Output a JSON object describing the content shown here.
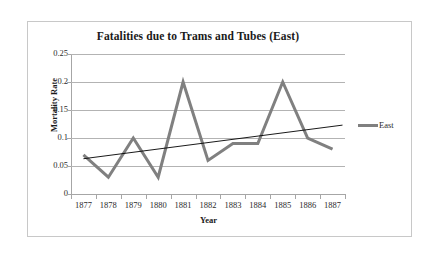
{
  "chart_data": {
    "type": "line",
    "title": "Fatalities due to Trams and Tubes (East)",
    "xlabel": "Year",
    "ylabel": "Mortality Rate",
    "categories": [
      "1877",
      "1878",
      "1879",
      "1880",
      "1881",
      "1882",
      "1883",
      "1884",
      "1885",
      "1886",
      "1887"
    ],
    "series": [
      {
        "name": "East",
        "color": "#808080",
        "values": [
          0.07,
          0.03,
          0.1,
          0.03,
          0.2,
          0.06,
          0.09,
          0.09,
          0.2,
          0.1,
          0.08
        ]
      }
    ],
    "trendline": {
      "name": "Linear trend",
      "color": "#000000",
      "start_value": 0.063,
      "end_value": 0.123
    },
    "ylim": [
      0,
      0.25
    ],
    "yticks": [
      0,
      0.05,
      0.1,
      0.15,
      0.2,
      0.25
    ],
    "ytick_labels": [
      "0",
      "0.05",
      "0.1",
      "0.15",
      "0.2",
      "0.25"
    ],
    "grid": "horizontal",
    "legend_position": "right",
    "legend_entries": [
      "East"
    ]
  },
  "colors": {
    "series_gray": "#808080",
    "trend_black": "#000000",
    "gridline": "#b3b3b3",
    "axis": "#a6a6a6",
    "frame_border": "#c8c8c8",
    "text": "#1a1a1a",
    "background": "#ffffff"
  }
}
